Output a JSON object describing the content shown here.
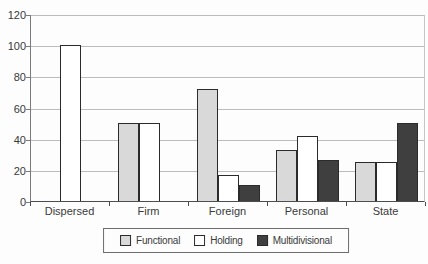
{
  "chart_data": {
    "type": "bar",
    "title": "",
    "xlabel": "",
    "ylabel": "",
    "categories": [
      "Dispersed",
      "Firm",
      "Foreign",
      "Personal",
      "State"
    ],
    "series": [
      {
        "name": "Functional",
        "color": "#d9d9d9",
        "values": [
          0,
          50,
          72,
          33,
          25
        ]
      },
      {
        "name": "Holding",
        "color": "#ffffff",
        "values": [
          100,
          50,
          17,
          42,
          25
        ]
      },
      {
        "name": "Multidivisional",
        "color": "#3f3f3f",
        "values": [
          0,
          0,
          10,
          26,
          50
        ]
      }
    ],
    "ylim": [
      0,
      120
    ],
    "y_ticks": [
      120,
      100,
      80,
      60,
      40,
      20,
      0
    ],
    "grid": true,
    "legend_position": "bottom",
    "colors": {
      "gridline": "#bcbcbc",
      "axis": "#4d4d4d",
      "bar_border": "#2b2b2b",
      "text": "#3a3a3a",
      "legend_border": "#6d6d6d",
      "background": "#fdfdfd"
    }
  }
}
